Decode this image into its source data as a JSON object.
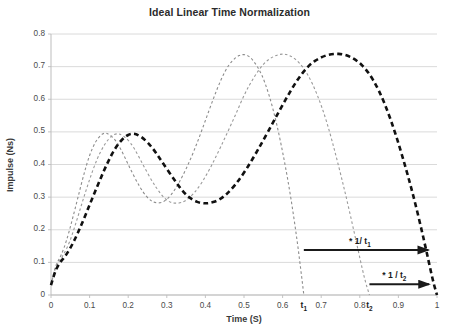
{
  "chart_data": {
    "type": "line",
    "title": "Ideal Linear Time Normalization",
    "xlabel": "Time (S)",
    "ylabel": "Impulse (Ns)",
    "xlim": [
      0,
      1
    ],
    "ylim": [
      0,
      0.8
    ],
    "grid": true,
    "legend": "none",
    "x_ticks": [
      "0",
      "0.1",
      "0.2",
      "0.3",
      "0.4",
      "0.5",
      "0.6",
      "0.7",
      "0.8",
      "0.9",
      "1"
    ],
    "x_tick_values": [
      0,
      0.1,
      0.2,
      0.3,
      0.4,
      0.5,
      0.6,
      0.7,
      0.8,
      0.9,
      1
    ],
    "y_ticks": [
      "0",
      "0.1",
      "0.2",
      "0.3",
      "0.4",
      "0.5",
      "0.6",
      "0.7",
      "0.8"
    ],
    "y_tick_values": [
      0,
      0.1,
      0.2,
      0.3,
      0.4,
      0.5,
      0.6,
      0.7,
      0.8
    ],
    "series": [
      {
        "name": "short-trial",
        "style": "fine-dashed",
        "color": "#8c8c8c",
        "width": 1.1,
        "end_time": 0.655,
        "points": [
          [
            0.0,
            0.03
          ],
          [
            0.008,
            0.075
          ],
          [
            0.016,
            0.1
          ],
          [
            0.026,
            0.12
          ],
          [
            0.04,
            0.165
          ],
          [
            0.055,
            0.23
          ],
          [
            0.07,
            0.3
          ],
          [
            0.085,
            0.37
          ],
          [
            0.1,
            0.43
          ],
          [
            0.115,
            0.47
          ],
          [
            0.13,
            0.492
          ],
          [
            0.14,
            0.497
          ],
          [
            0.15,
            0.493
          ],
          [
            0.165,
            0.478
          ],
          [
            0.18,
            0.45
          ],
          [
            0.2,
            0.4
          ],
          [
            0.22,
            0.352
          ],
          [
            0.24,
            0.312
          ],
          [
            0.255,
            0.292
          ],
          [
            0.268,
            0.283
          ],
          [
            0.285,
            0.282
          ],
          [
            0.3,
            0.292
          ],
          [
            0.32,
            0.32
          ],
          [
            0.34,
            0.362
          ],
          [
            0.36,
            0.412
          ],
          [
            0.38,
            0.47
          ],
          [
            0.4,
            0.535
          ],
          [
            0.42,
            0.6
          ],
          [
            0.44,
            0.66
          ],
          [
            0.46,
            0.706
          ],
          [
            0.48,
            0.73
          ],
          [
            0.495,
            0.738
          ],
          [
            0.51,
            0.735
          ],
          [
            0.525,
            0.718
          ],
          [
            0.545,
            0.68
          ],
          [
            0.565,
            0.615
          ],
          [
            0.585,
            0.525
          ],
          [
            0.605,
            0.41
          ],
          [
            0.622,
            0.295
          ],
          [
            0.638,
            0.165
          ],
          [
            0.65,
            0.05
          ],
          [
            0.655,
            0.0
          ]
        ]
      },
      {
        "name": "medium-trial",
        "style": "fine-dashed",
        "color": "#9a9a9a",
        "width": 1.1,
        "end_time": 0.825,
        "points": [
          [
            0.0,
            0.03
          ],
          [
            0.008,
            0.072
          ],
          [
            0.018,
            0.098
          ],
          [
            0.03,
            0.118
          ],
          [
            0.048,
            0.16
          ],
          [
            0.065,
            0.222
          ],
          [
            0.082,
            0.288
          ],
          [
            0.1,
            0.355
          ],
          [
            0.12,
            0.42
          ],
          [
            0.14,
            0.465
          ],
          [
            0.158,
            0.489
          ],
          [
            0.17,
            0.495
          ],
          [
            0.182,
            0.492
          ],
          [
            0.198,
            0.478
          ],
          [
            0.215,
            0.452
          ],
          [
            0.238,
            0.4
          ],
          [
            0.262,
            0.348
          ],
          [
            0.285,
            0.308
          ],
          [
            0.302,
            0.288
          ],
          [
            0.318,
            0.281
          ],
          [
            0.338,
            0.282
          ],
          [
            0.358,
            0.296
          ],
          [
            0.382,
            0.328
          ],
          [
            0.405,
            0.372
          ],
          [
            0.428,
            0.425
          ],
          [
            0.452,
            0.485
          ],
          [
            0.478,
            0.552
          ],
          [
            0.502,
            0.618
          ],
          [
            0.528,
            0.672
          ],
          [
            0.552,
            0.712
          ],
          [
            0.578,
            0.733
          ],
          [
            0.6,
            0.74
          ],
          [
            0.62,
            0.734
          ],
          [
            0.642,
            0.715
          ],
          [
            0.665,
            0.678
          ],
          [
            0.69,
            0.615
          ],
          [
            0.715,
            0.53
          ],
          [
            0.74,
            0.42
          ],
          [
            0.765,
            0.3
          ],
          [
            0.79,
            0.168
          ],
          [
            0.812,
            0.05
          ],
          [
            0.825,
            0.0
          ]
        ]
      },
      {
        "name": "normalized-trial",
        "style": "bold-dashed",
        "color": "#111111",
        "width": 2.6,
        "end_time": 1.0,
        "points": [
          [
            0.0,
            0.03
          ],
          [
            0.01,
            0.072
          ],
          [
            0.022,
            0.098
          ],
          [
            0.038,
            0.12
          ],
          [
            0.058,
            0.16
          ],
          [
            0.08,
            0.218
          ],
          [
            0.102,
            0.282
          ],
          [
            0.125,
            0.348
          ],
          [
            0.148,
            0.41
          ],
          [
            0.17,
            0.458
          ],
          [
            0.192,
            0.486
          ],
          [
            0.208,
            0.495
          ],
          [
            0.222,
            0.493
          ],
          [
            0.24,
            0.48
          ],
          [
            0.262,
            0.453
          ],
          [
            0.288,
            0.408
          ],
          [
            0.318,
            0.355
          ],
          [
            0.345,
            0.312
          ],
          [
            0.368,
            0.29
          ],
          [
            0.39,
            0.281
          ],
          [
            0.412,
            0.281
          ],
          [
            0.438,
            0.292
          ],
          [
            0.465,
            0.32
          ],
          [
            0.492,
            0.36
          ],
          [
            0.52,
            0.412
          ],
          [
            0.548,
            0.47
          ],
          [
            0.578,
            0.535
          ],
          [
            0.608,
            0.6
          ],
          [
            0.638,
            0.66
          ],
          [
            0.668,
            0.705
          ],
          [
            0.7,
            0.73
          ],
          [
            0.73,
            0.74
          ],
          [
            0.76,
            0.738
          ],
          [
            0.79,
            0.722
          ],
          [
            0.82,
            0.688
          ],
          [
            0.85,
            0.628
          ],
          [
            0.88,
            0.54
          ],
          [
            0.91,
            0.428
          ],
          [
            0.94,
            0.3
          ],
          [
            0.968,
            0.16
          ],
          [
            0.99,
            0.04
          ],
          [
            1.0,
            0.0
          ]
        ]
      }
    ],
    "markers": [
      {
        "name": "t1",
        "label": "t",
        "sub": "1",
        "x": 0.655
      },
      {
        "name": "t2",
        "label": "t",
        "sub": "2",
        "x": 0.825
      }
    ],
    "annotations": [
      {
        "name": "scale-arrow-t1",
        "label": "* 1/ t",
        "sub": "1",
        "x_start": 0.655,
        "x_end": 0.993,
        "y": 0.138
      },
      {
        "name": "scale-arrow-t2",
        "label": "* 1 / t",
        "sub": "2",
        "x_start": 0.825,
        "x_end": 0.995,
        "y": 0.033
      }
    ],
    "colors": {
      "gridline": "#d6d6d6",
      "axis": "#bdbdbd",
      "title_text": "#2b2b2b",
      "tick_text": "#4a4a4a",
      "annotation": "#1a1a1a",
      "background": "#ffffff"
    }
  }
}
